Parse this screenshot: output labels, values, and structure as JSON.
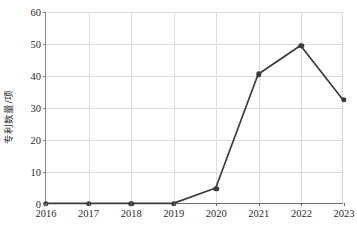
{
  "chart_data": {
    "type": "line",
    "title": "",
    "xlabel": "",
    "ylabel": "专利数量/项",
    "categories": [
      "2016",
      "2017",
      "2018",
      "2019",
      "2020",
      "2021",
      "2022",
      "2023"
    ],
    "values": [
      0,
      0,
      0,
      0,
      4.8,
      40.5,
      49.5,
      32.5
    ],
    "series": [
      {
        "name": "专利数量",
        "values": [
          0,
          0,
          0,
          0,
          4.8,
          40.5,
          49.5,
          32.5
        ]
      }
    ],
    "x": [
      2016,
      2017,
      2018,
      2019,
      2020,
      2021,
      2022,
      2023
    ],
    "ylim": [
      0,
      60
    ],
    "yticks": [
      0,
      10,
      20,
      30,
      40,
      50,
      60
    ],
    "ytick_labels": [
      "0",
      "10",
      "20",
      "30",
      "40",
      "50",
      "60"
    ],
    "xtick_labels": [
      "2016",
      "2017",
      "2018",
      "2019",
      "2020",
      "2021",
      "2022",
      "2023"
    ],
    "grid": true,
    "legend": false,
    "legend_position": "none",
    "marker": "circle",
    "line_color": "#3b3b3b",
    "marker_color": "#3b3b3b",
    "grid_color": "#dcdcdc",
    "axis_color": "#6d6d6d",
    "background_color": "#ffffff",
    "text_color": "#2b2b2b"
  }
}
